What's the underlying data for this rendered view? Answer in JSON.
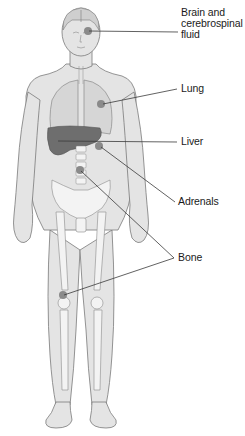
{
  "diagram": {
    "type": "anatomical-figure",
    "colors": {
      "background": "#ffffff",
      "body_fill": "#e4e4e4",
      "body_outline": "#7a7a7a",
      "bone_fill": "#f3f3f3",
      "lung_fill": "#d6d6d6",
      "liver_fill": "#6e6e6e",
      "site_dot": "#8a8a8a",
      "leader_line": "#3a3a3a",
      "label_text": "#1a1a1a"
    },
    "labels": [
      {
        "id": "brain",
        "text": "Brain and\ncerebrospinal\nfluid",
        "x": 180,
        "y": 8,
        "target": [
          87,
          31
        ]
      },
      {
        "id": "lung",
        "text": "Lung",
        "x": 180,
        "y": 84,
        "target": [
          101,
          103
        ]
      },
      {
        "id": "liver",
        "text": "Liver",
        "x": 180,
        "y": 136,
        "target": [
          63,
          141
        ]
      },
      {
        "id": "adrenals",
        "text": "Adrenals",
        "x": 180,
        "y": 196,
        "target": [
          100,
          146
        ]
      },
      {
        "id": "bone",
        "text": "Bone",
        "x": 180,
        "y": 253,
        "targets": [
          [
            80,
            170
          ],
          [
            63,
            295
          ]
        ]
      }
    ]
  }
}
